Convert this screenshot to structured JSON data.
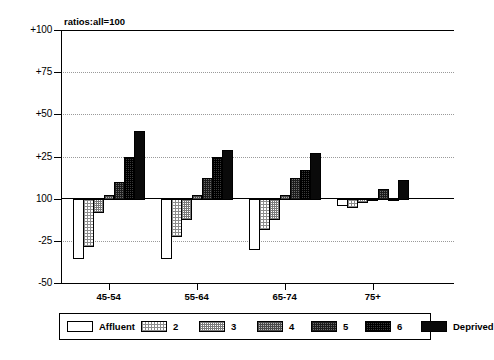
{
  "chart_data": {
    "type": "bar",
    "title": "",
    "note": "ratios:all=100",
    "xlabel": "",
    "ylabel": "",
    "categories": [
      "45-54",
      "55-64",
      "65-74",
      "75+"
    ],
    "ylim": [
      -50,
      100
    ],
    "baseline_value": 100,
    "baseline_label": "100",
    "y_ticks": [
      {
        "value": 100,
        "label": "+100"
      },
      {
        "value": 75,
        "label": "+75"
      },
      {
        "value": 50,
        "label": "+50"
      },
      {
        "value": 25,
        "label": "+25"
      },
      {
        "value": 0,
        "label": "100"
      },
      {
        "value": -25,
        "label": "-25"
      },
      {
        "value": -50,
        "label": "-50"
      }
    ],
    "gridlines": [
      75,
      50,
      25,
      -25
    ],
    "grid": true,
    "legend_position": "bottom",
    "series": [
      {
        "name": "Affluent",
        "fill": "f-0",
        "values": [
          -35,
          -35,
          -30,
          -4
        ]
      },
      {
        "name": "2",
        "fill": "f-1",
        "values": [
          -28,
          -22,
          -18,
          -5
        ]
      },
      {
        "name": "3",
        "fill": "f-2",
        "values": [
          -8,
          -12,
          -12,
          -2
        ]
      },
      {
        "name": "4",
        "fill": "f-3",
        "values": [
          2,
          2,
          2,
          0
        ]
      },
      {
        "name": "5",
        "fill": "f-4",
        "values": [
          10,
          12,
          12,
          6
        ]
      },
      {
        "name": "6",
        "fill": "f-5",
        "values": [
          25,
          25,
          17,
          0
        ]
      },
      {
        "name": "Deprived",
        "fill": "f-6",
        "values": [
          40,
          29,
          27,
          11
        ]
      }
    ]
  },
  "legend": {
    "items": [
      {
        "label": "Affluent",
        "fill": "f-0"
      },
      {
        "label": "2",
        "fill": "f-1"
      },
      {
        "label": "3",
        "fill": "f-2"
      },
      {
        "label": "4",
        "fill": "f-3"
      },
      {
        "label": "5",
        "fill": "f-4"
      },
      {
        "label": "6",
        "fill": "f-5"
      },
      {
        "label": "Deprived",
        "fill": "f-6"
      }
    ]
  },
  "caption": {
    "text": ""
  }
}
